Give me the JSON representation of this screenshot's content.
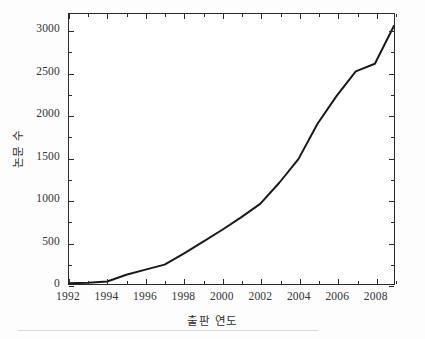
{
  "chart_data": {
    "type": "line",
    "title": "",
    "xlabel": "출판 연도",
    "ylabel": "논문 수",
    "xlim": [
      1992,
      2009
    ],
    "ylim": [
      0,
      3200
    ],
    "grid": false,
    "legend": null,
    "x_tick_labels": [
      "1992",
      "1994",
      "1996",
      "1998",
      "2000",
      "2002",
      "2004",
      "2006",
      "2008"
    ],
    "x_tick_values": [
      1992,
      1994,
      1996,
      1998,
      2000,
      2002,
      2004,
      2006,
      2008
    ],
    "x_minor_ticks": [
      1993,
      1995,
      1997,
      1999,
      2001,
      2003,
      2005,
      2007,
      2009
    ],
    "y_tick_labels": [
      "0",
      "500",
      "1000",
      "1500",
      "2000",
      "2500",
      "3000"
    ],
    "y_tick_values": [
      0,
      500,
      1000,
      1500,
      2000,
      2500,
      3000
    ],
    "y_minor_ticks": [
      250,
      750,
      1250,
      1750,
      2250,
      2750
    ],
    "line_color": "#1a1a1a",
    "line_width": 2.0,
    "x": [
      1992,
      1993,
      1994,
      1995,
      1996,
      1997,
      1998,
      1999,
      2000,
      2001,
      2002,
      2003,
      2004,
      2005,
      2006,
      2007,
      2008,
      2009
    ],
    "values": [
      10,
      15,
      30,
      110,
      170,
      230,
      360,
      500,
      640,
      790,
      950,
      1200,
      1480,
      1900,
      2230,
      2520,
      2610,
      3060
    ],
    "series": [
      {
        "name": "논문 수",
        "values": [
          10,
          15,
          30,
          110,
          170,
          230,
          360,
          500,
          640,
          790,
          950,
          1200,
          1480,
          1900,
          2230,
          2520,
          2610,
          3060
        ]
      }
    ]
  },
  "axes": {
    "frame_color": "#2b2b2b"
  }
}
